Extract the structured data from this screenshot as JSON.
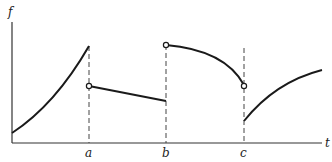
{
  "diagram": {
    "title": "",
    "y_axis_label": "f",
    "x_axis_label": "t",
    "x_marks": [
      {
        "label": "a"
      },
      {
        "label": "b"
      },
      {
        "label": "c"
      }
    ],
    "pieces": [
      {
        "interval": "[0, a]",
        "shape": "increasing convex curve",
        "left_endpoint": "closed",
        "right_endpoint": "closed"
      },
      {
        "interval": "(a, b]",
        "shape": "decreasing straight line",
        "left_endpoint": "open",
        "right_endpoint": "closed"
      },
      {
        "interval": "(b, c)",
        "shape": "decreasing concave curve",
        "left_endpoint": "open",
        "right_endpoint": "open"
      },
      {
        "interval": "[c, end]",
        "shape": "increasing concave curve",
        "left_endpoint": "closed",
        "right_endpoint": "none"
      }
    ],
    "colors": {
      "line": "#1a1a1a",
      "background": "#ffffff"
    }
  }
}
